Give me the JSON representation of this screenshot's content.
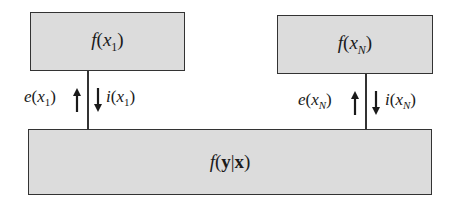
{
  "diagram": {
    "type": "factor-graph-message-passing",
    "nodes": {
      "left": {
        "fn": "f",
        "var": "x",
        "sub": "1"
      },
      "right": {
        "fn": "f",
        "var": "x",
        "sub": "N"
      },
      "bottom": {
        "fn": "f",
        "y": "y",
        "bar": "|",
        "x": "x"
      }
    },
    "edges": [
      {
        "from": "left",
        "to": "bottom",
        "up_label": {
          "fn": "e",
          "var": "x",
          "sub": "1"
        },
        "down_label": {
          "fn": "i",
          "var": "x",
          "sub": "1"
        }
      },
      {
        "from": "right",
        "to": "bottom",
        "up_label": {
          "fn": "e",
          "var": "x",
          "sub": "N"
        },
        "down_label": {
          "fn": "i",
          "var": "x",
          "sub": "N"
        }
      }
    ],
    "colors": {
      "box_fill": "#dcdcdc",
      "stroke": "#333333",
      "text": "#1a1a1a"
    }
  },
  "text": {
    "paren_open": "(",
    "paren_close": ")"
  }
}
